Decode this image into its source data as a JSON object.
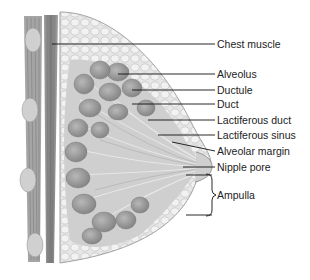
{
  "figure": {
    "labels": [
      {
        "id": "chest-muscle",
        "text": "Chest muscle",
        "x": 217,
        "y": 38
      },
      {
        "id": "alveolus",
        "text": "Alveolus",
        "x": 217,
        "y": 68
      },
      {
        "id": "ductule",
        "text": "Ductule",
        "x": 217,
        "y": 84
      },
      {
        "id": "duct",
        "text": "Duct",
        "x": 217,
        "y": 98
      },
      {
        "id": "lactiferous-duct",
        "text": "Lactiferous duct",
        "x": 217,
        "y": 114
      },
      {
        "id": "lactiferous-sinus",
        "text": "Lactiferous sinus",
        "x": 217,
        "y": 130
      },
      {
        "id": "alveolar-margin",
        "text": "Alveolar margin",
        "x": 217,
        "y": 145
      },
      {
        "id": "nipple-pore",
        "text": "Nipple pore",
        "x": 217,
        "y": 160
      },
      {
        "id": "ampulla",
        "text": "Ampulla",
        "x": 216,
        "y": 189
      }
    ],
    "colors": {
      "muscle": "#8a8a8a",
      "muscle_light": "#b5b5b5",
      "fat": "#e2e2e2",
      "lobule": "#9c9c9c",
      "duct": "#c9c9c9",
      "leader": "#111111"
    }
  }
}
